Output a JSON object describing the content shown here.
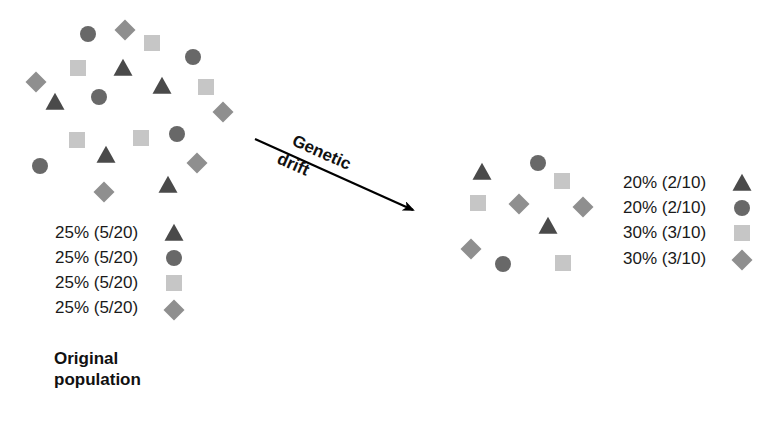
{
  "colors": {
    "triangle": "#4a4a4a",
    "circle": "#686868",
    "square": "#c6c6c6",
    "diamond": "#8f8f8f",
    "arrow": "#000000"
  },
  "original_population": {
    "caption_line1": "Original",
    "caption_line2": "population",
    "shapes": [
      {
        "type": "circle",
        "x": 88,
        "y": 34
      },
      {
        "type": "diamond",
        "x": 125,
        "y": 30
      },
      {
        "type": "square",
        "x": 152,
        "y": 43
      },
      {
        "type": "circle",
        "x": 193,
        "y": 57
      },
      {
        "type": "square",
        "x": 78,
        "y": 68
      },
      {
        "type": "triangle",
        "x": 123,
        "y": 68
      },
      {
        "type": "diamond",
        "x": 36,
        "y": 82
      },
      {
        "type": "triangle",
        "x": 162,
        "y": 86
      },
      {
        "type": "square",
        "x": 206,
        "y": 87
      },
      {
        "type": "triangle",
        "x": 55,
        "y": 102
      },
      {
        "type": "circle",
        "x": 99,
        "y": 97
      },
      {
        "type": "diamond",
        "x": 223,
        "y": 112
      },
      {
        "type": "square",
        "x": 77,
        "y": 140
      },
      {
        "type": "square",
        "x": 141,
        "y": 138
      },
      {
        "type": "circle",
        "x": 177,
        "y": 134
      },
      {
        "type": "triangle",
        "x": 106,
        "y": 155
      },
      {
        "type": "diamond",
        "x": 197,
        "y": 163
      },
      {
        "type": "circle",
        "x": 40,
        "y": 166
      },
      {
        "type": "triangle",
        "x": 168,
        "y": 185
      },
      {
        "type": "diamond",
        "x": 104,
        "y": 192
      }
    ],
    "legend": [
      {
        "label": "25% (5/20)",
        "shape": "triangle"
      },
      {
        "label": "25% (5/20)",
        "shape": "circle"
      },
      {
        "label": "25% (5/20)",
        "shape": "square"
      },
      {
        "label": "25% (5/20)",
        "shape": "diamond"
      }
    ]
  },
  "arrow": {
    "label_line1": "Genetic",
    "label_line2": "drift",
    "x1": 255,
    "y1": 139,
    "x2": 413,
    "y2": 210
  },
  "drifted_population": {
    "shapes": [
      {
        "type": "triangle",
        "x": 482,
        "y": 172
      },
      {
        "type": "circle",
        "x": 538,
        "y": 163
      },
      {
        "type": "square",
        "x": 562,
        "y": 181
      },
      {
        "type": "square",
        "x": 478,
        "y": 203
      },
      {
        "type": "diamond",
        "x": 519,
        "y": 204
      },
      {
        "type": "diamond",
        "x": 583,
        "y": 207
      },
      {
        "type": "triangle",
        "x": 548,
        "y": 226
      },
      {
        "type": "diamond",
        "x": 471,
        "y": 249
      },
      {
        "type": "circle",
        "x": 503,
        "y": 264
      },
      {
        "type": "square",
        "x": 563,
        "y": 263
      }
    ],
    "legend": [
      {
        "label": "20% (2/10)",
        "shape": "triangle"
      },
      {
        "label": "20% (2/10)",
        "shape": "circle"
      },
      {
        "label": "30% (3/10)",
        "shape": "square"
      },
      {
        "label": "30% (3/10)",
        "shape": "diamond"
      }
    ]
  }
}
